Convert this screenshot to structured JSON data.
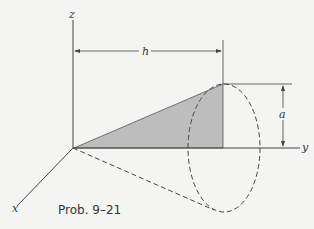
{
  "figure": {
    "caption": "Prob. 9–21",
    "axes": {
      "x_label": "x",
      "y_label": "y",
      "z_label": "z"
    },
    "dimensions": {
      "length_label": "h",
      "radius_label": "a"
    },
    "colors": {
      "shaded_triangle": "#bdbdbd",
      "lines": "#444444",
      "background": "#f4f4f2"
    }
  }
}
